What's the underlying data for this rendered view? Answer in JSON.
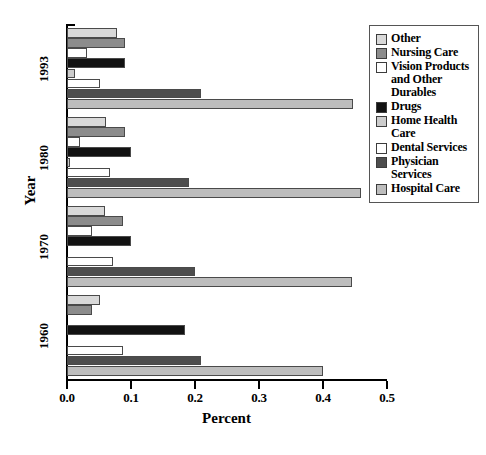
{
  "chart_data": {
    "type": "bar",
    "orientation": "horizontal",
    "title": "",
    "xlabel": "Percent",
    "ylabel": "Year",
    "xlim": [
      0.0,
      0.5
    ],
    "xticks": [
      "0.0",
      "0.1",
      "0.2",
      "0.3",
      "0.4",
      "0.5"
    ],
    "xtick_values": [
      0.0,
      0.1,
      0.2,
      0.3,
      0.4,
      0.5
    ],
    "categories": [
      "1960",
      "1970",
      "1980",
      "1993"
    ],
    "grid": false,
    "legend_position": "right",
    "series": [
      {
        "name": "Other",
        "color": "#d9d9d9",
        "values": [
          0.052,
          0.059,
          0.061,
          0.078
        ]
      },
      {
        "name": "Nursing Care",
        "color": "#8c8c8c",
        "values": [
          0.039,
          0.088,
          0.09,
          0.09
        ]
      },
      {
        "name": "Vision Products and Other Durables",
        "color": "#ffffff",
        "values": [
          0.0,
          0.039,
          0.02,
          0.031
        ]
      },
      {
        "name": "Drugs",
        "color": "#121212",
        "values": [
          0.185,
          0.1,
          0.1,
          0.09
        ]
      },
      {
        "name": "Home Health Care",
        "color": "#cccccc",
        "values": [
          0.0,
          0.0,
          0.005,
          0.012
        ]
      },
      {
        "name": "Dental Services",
        "color": "#ffffff",
        "values": [
          0.088,
          0.072,
          0.067,
          0.052
        ]
      },
      {
        "name": "Physician Services",
        "color": "#4d4d4d",
        "values": [
          0.21,
          0.2,
          0.19,
          0.21
        ]
      },
      {
        "name": "Hospital Care",
        "color": "#bdbdbd",
        "values": [
          0.4,
          0.445,
          0.46,
          0.447
        ]
      }
    ]
  },
  "legend": {
    "items": [
      {
        "label": "Other",
        "color": "#d9d9d9"
      },
      {
        "label": "Nursing Care",
        "color": "#8c8c8c"
      },
      {
        "label": "Vision Products and Other Durables",
        "color": "#ffffff"
      },
      {
        "label": "Drugs",
        "color": "#121212"
      },
      {
        "label": "Home Health Care",
        "color": "#cccccc"
      },
      {
        "label": "Dental Services",
        "color": "#ffffff"
      },
      {
        "label": "Physician Services",
        "color": "#4d4d4d"
      },
      {
        "label": "Hospital Care",
        "color": "#bdbdbd"
      }
    ]
  },
  "axes": {
    "x_title": "Percent",
    "y_title": "Year",
    "x_tick_labels": [
      "0.0",
      "0.1",
      "0.2",
      "0.3",
      "0.4",
      "0.5"
    ],
    "y_group_labels": [
      "1993",
      "1980",
      "1970",
      "1960"
    ]
  }
}
